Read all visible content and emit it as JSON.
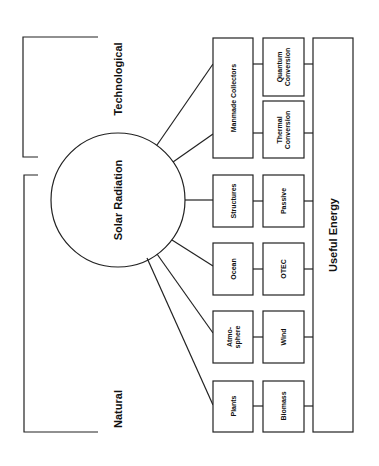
{
  "diagram": {
    "center": {
      "label": "Solar Radiation"
    },
    "groups": {
      "technological": {
        "label": "Technological"
      },
      "natural": {
        "label": "Natural"
      }
    },
    "sources": [
      {
        "id": "manmade",
        "label": "Manmade Collectors"
      },
      {
        "id": "structures",
        "label": "Structures"
      },
      {
        "id": "ocean",
        "label": "Ocean"
      },
      {
        "id": "atmosphere",
        "label_line1": "Atmo-",
        "label_line2": "sphere"
      },
      {
        "id": "plants",
        "label": "Plants"
      }
    ],
    "conversions": [
      {
        "id": "quantum",
        "label_line1": "Quantum",
        "label_line2": "Conversion"
      },
      {
        "id": "thermal",
        "label_line1": "Thermal",
        "label_line2": "Conversion"
      },
      {
        "id": "passive",
        "label": "Passive"
      },
      {
        "id": "otec",
        "label": "OTEC"
      },
      {
        "id": "wind",
        "label": "Wind"
      },
      {
        "id": "biomass",
        "label": "Biomass"
      }
    ],
    "output": {
      "label": "Useful Energy"
    },
    "colors": {
      "line": "#222222",
      "background": "#ffffff",
      "text": "#111111"
    }
  }
}
